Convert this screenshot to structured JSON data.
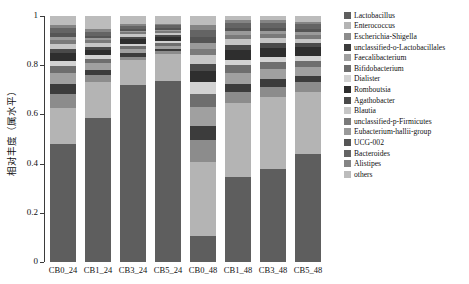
{
  "chart_data": {
    "type": "bar",
    "stacked": true,
    "title": "",
    "xlabel": "",
    "ylabel": "相对丰度（属水平）",
    "ylim": [
      0,
      1
    ],
    "ytick_labels": [
      "0",
      "0.2",
      "0.4",
      "0.6",
      "0.8",
      "1"
    ],
    "ytick_values": [
      0,
      0.2,
      0.4,
      0.6,
      0.8,
      1
    ],
    "grid": false,
    "legend_position": "right",
    "categories": [
      "CB0_24",
      "CB1_24",
      "CB3_24",
      "CB5_24",
      "CB0_48",
      "CB1_48",
      "CB3_48",
      "CB5_48"
    ],
    "series": [
      {
        "name": "Lactobacillus",
        "color": "#5e5e5e",
        "values": [
          0.48,
          0.585,
          0.72,
          0.735,
          0.105,
          0.345,
          0.38,
          0.44
        ]
      },
      {
        "name": "Enterococcus",
        "color": "#b4b4b4",
        "values": [
          0.145,
          0.145,
          0.1,
          0.11,
          0.3,
          0.3,
          0.29,
          0.25
        ]
      },
      {
        "name": "Escherichia-Shigella",
        "color": "#8c8c8c",
        "values": [
          0.06,
          0.03,
          0.015,
          0.012,
          0.09,
          0.045,
          0.042,
          0.04
        ]
      },
      {
        "name": "unclassified-o-Lactobacillales",
        "color": "#3c3c3c",
        "values": [
          0.04,
          0.022,
          0.014,
          0.01,
          0.06,
          0.035,
          0.032,
          0.028
        ]
      },
      {
        "name": "Faecalibacterium",
        "color": "#a0a0a0",
        "values": [
          0.042,
          0.026,
          0.016,
          0.012,
          0.075,
          0.044,
          0.04,
          0.035
        ]
      },
      {
        "name": "Bifidobacterium",
        "color": "#6e6e6e",
        "values": [
          0.03,
          0.018,
          0.012,
          0.01,
          0.055,
          0.03,
          0.028,
          0.025
        ]
      },
      {
        "name": "Dialister",
        "color": "#d2d2d2",
        "values": [
          0.022,
          0.014,
          0.01,
          0.008,
          0.045,
          0.024,
          0.022,
          0.02
        ]
      },
      {
        "name": "Romboutsia",
        "color": "#2e2e2e",
        "values": [
          0.03,
          0.024,
          0.02,
          0.018,
          0.045,
          0.04,
          0.038,
          0.036
        ]
      },
      {
        "name": "Agathobacter",
        "color": "#4a4a4a",
        "values": [
          0.018,
          0.012,
          0.009,
          0.008,
          0.03,
          0.02,
          0.018,
          0.016
        ]
      },
      {
        "name": "Blautia",
        "color": "#c6c6c6",
        "values": [
          0.02,
          0.014,
          0.01,
          0.009,
          0.035,
          0.022,
          0.02,
          0.018
        ]
      },
      {
        "name": "unclassified-p-Firmicutes",
        "color": "#7a7a7a",
        "values": [
          0.016,
          0.011,
          0.008,
          0.007,
          0.028,
          0.018,
          0.016,
          0.015
        ]
      },
      {
        "name": "Eubacterium-hallii-group",
        "color": "#9a9a9a",
        "values": [
          0.014,
          0.01,
          0.007,
          0.006,
          0.024,
          0.015,
          0.014,
          0.013
        ]
      },
      {
        "name": "UCG-002",
        "color": "#555555",
        "values": [
          0.013,
          0.009,
          0.007,
          0.006,
          0.022,
          0.014,
          0.013,
          0.012
        ]
      },
      {
        "name": "Bacteroides",
        "color": "#646464",
        "values": [
          0.02,
          0.016,
          0.012,
          0.011,
          0.028,
          0.02,
          0.019,
          0.018
        ]
      },
      {
        "name": "Alistipes",
        "color": "#848484",
        "values": [
          0.014,
          0.011,
          0.009,
          0.008,
          0.02,
          0.014,
          0.013,
          0.012
        ]
      },
      {
        "name": "others",
        "color": "#bcbcbc",
        "values": [
          0.036,
          0.053,
          0.031,
          0.03,
          0.038,
          0.014,
          0.015,
          0.022
        ]
      }
    ]
  },
  "axis": {
    "ylabel": "相对丰度（属水平）",
    "ticks": [
      {
        "label": "1",
        "value": 1
      },
      {
        "label": "0.8",
        "value": 0.8
      },
      {
        "label": "0.6",
        "value": 0.6
      },
      {
        "label": "0.4",
        "value": 0.4
      },
      {
        "label": "0.2",
        "value": 0.2
      },
      {
        "label": "0",
        "value": 0
      }
    ]
  },
  "legend": {
    "items": [
      {
        "label": "Lactobacillus",
        "color": "#5e5e5e"
      },
      {
        "label": "Enterococcus",
        "color": "#b4b4b4"
      },
      {
        "label": "Escherichia-Shigella",
        "color": "#8c8c8c"
      },
      {
        "label": "unclassified-o-Lactobacillales",
        "color": "#3c3c3c"
      },
      {
        "label": "Faecalibacterium",
        "color": "#a0a0a0"
      },
      {
        "label": "Bifidobacterium",
        "color": "#6e6e6e"
      },
      {
        "label": "Dialister",
        "color": "#d2d2d2"
      },
      {
        "label": "Romboutsia",
        "color": "#2e2e2e"
      },
      {
        "label": "Agathobacter",
        "color": "#4a4a4a"
      },
      {
        "label": "Blautia",
        "color": "#c6c6c6"
      },
      {
        "label": "unclassified-p-Firmicutes",
        "color": "#7a7a7a"
      },
      {
        "label": "Eubacterium-hallii-group",
        "color": "#9a9a9a"
      },
      {
        "label": "UCG-002",
        "color": "#555555"
      },
      {
        "label": "Bacteroides",
        "color": "#646464"
      },
      {
        "label": "Alistipes",
        "color": "#848484"
      },
      {
        "label": "others",
        "color": "#bcbcbc"
      }
    ]
  }
}
